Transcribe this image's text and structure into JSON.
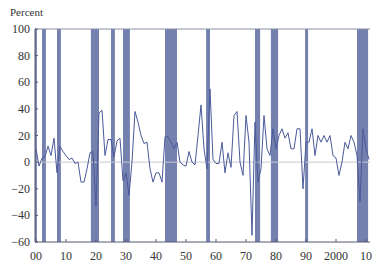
{
  "chart_data": {
    "type": "line",
    "title": "",
    "ylabel": "Percent",
    "xlabel": "",
    "ylim": [
      -60,
      100
    ],
    "xlim": [
      1900,
      2011
    ],
    "yticks": [
      100,
      80,
      60,
      40,
      20,
      0,
      -20,
      -40,
      -60
    ],
    "ytick_labels": [
      "100",
      "80",
      "60",
      "40",
      "20",
      "0",
      "−20",
      "−40",
      "−60"
    ],
    "xticks": [
      1900,
      1910,
      1920,
      1930,
      1940,
      1950,
      1960,
      1970,
      1980,
      1990,
      2000,
      2010
    ],
    "xtick_labels": [
      "00",
      "10",
      "20",
      "30",
      "40",
      "50",
      "60",
      "70",
      "80",
      "90",
      "2000",
      "10"
    ],
    "grid": false,
    "zero_line": true,
    "series": [
      {
        "name": "Percent change",
        "color": "#4a5a9a",
        "x": [
          1900,
          1901,
          1902,
          1903,
          1904,
          1905,
          1906,
          1907,
          1908,
          1909,
          1910,
          1911,
          1912,
          1913,
          1914,
          1915,
          1916,
          1917,
          1918,
          1919,
          1920,
          1921,
          1922,
          1923,
          1924,
          1925,
          1926,
          1927,
          1928,
          1929,
          1930,
          1931,
          1932,
          1933,
          1934,
          1935,
          1936,
          1937,
          1938,
          1939,
          1940,
          1941,
          1942,
          1943,
          1944,
          1945,
          1946,
          1947,
          1948,
          1949,
          1950,
          1951,
          1952,
          1953,
          1954,
          1955,
          1956,
          1957,
          1958,
          1959,
          1960,
          1961,
          1962,
          1963,
          1964,
          1965,
          1966,
          1967,
          1968,
          1969,
          1970,
          1971,
          1972,
          1973,
          1974,
          1975,
          1976,
          1977,
          1978,
          1979,
          1980,
          1981,
          1982,
          1983,
          1984,
          1985,
          1986,
          1987,
          1988,
          1989,
          1990,
          1991,
          1992,
          1993,
          1994,
          1995,
          1996,
          1997,
          1998,
          1999,
          2000,
          2001,
          2002,
          2003,
          2004,
          2005,
          2006,
          2007,
          2008,
          2009,
          2010,
          2011
        ],
        "values": [
          10,
          -3,
          3,
          4,
          12,
          5,
          18,
          -8,
          12,
          8,
          5,
          2,
          3,
          -1,
          0,
          -15,
          -15,
          -5,
          7,
          8,
          -33,
          37,
          39,
          5,
          17,
          17,
          4,
          16,
          18,
          -14,
          -8,
          -25,
          0,
          38,
          30,
          20,
          14,
          15,
          -5,
          -15,
          -8,
          -8,
          -15,
          19,
          19,
          15,
          10,
          15,
          0,
          -2,
          -3,
          8,
          0,
          -2,
          20,
          43,
          10,
          -5,
          55,
          2,
          -1,
          -1,
          15,
          -8,
          7,
          -4,
          35,
          38,
          0,
          -10,
          35,
          15,
          -55,
          30,
          -15,
          -5,
          35,
          10,
          5,
          25,
          10,
          20,
          25,
          18,
          22,
          10,
          10,
          25,
          25,
          -20,
          15,
          15,
          25,
          5,
          20,
          15,
          20,
          15,
          20,
          5,
          3,
          -10,
          0,
          15,
          10,
          20,
          15,
          5,
          -30,
          25,
          10,
          2
        ]
      }
    ],
    "shaded_regions": {
      "color": "#5c6aa0",
      "label": "Recession periods",
      "spans": [
        [
          1899.0,
          1900.3
        ],
        [
          1902.0,
          1903.3
        ],
        [
          1907.0,
          1908.3
        ],
        [
          1918.3,
          1921.0
        ],
        [
          1925.0,
          1926.3
        ],
        [
          1929.0,
          1931.3
        ],
        [
          1943.0,
          1947.0
        ],
        [
          1956.7,
          1958.0
        ],
        [
          1973.0,
          1974.7
        ],
        [
          1978.3,
          1980.7
        ],
        [
          1989.7,
          1990.7
        ],
        [
          2007.0,
          2010.7
        ]
      ]
    }
  }
}
